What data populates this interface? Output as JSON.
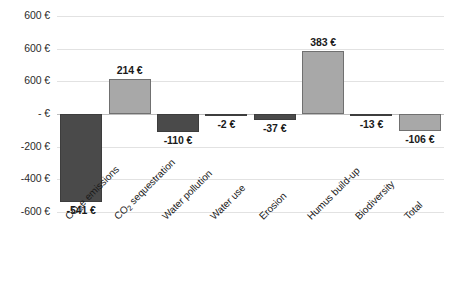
{
  "chart_data": {
    "type": "bar",
    "title": "",
    "xlabel": "",
    "ylabel": "",
    "categories": [
      "CO2e emissions",
      "CO2 sequestration",
      "Water pollution",
      "Water use",
      "Erosion",
      "Humus build-up",
      "Biodiversity",
      "Total"
    ],
    "values": [
      -541,
      214,
      -110,
      -2,
      -37,
      383,
      -13,
      -106
    ],
    "data_labels": [
      "-541 €",
      "214 €",
      "-110 €",
      "-2 €",
      "-37 €",
      "383 €",
      "-13 €",
      "-106 €"
    ],
    "ylim": [
      -600,
      600
    ],
    "ytick_values": [
      600,
      400,
      200,
      0,
      -200,
      -400,
      -600
    ],
    "ytick_labels": [
      "600 €",
      "600 €",
      "600 €",
      "- €",
      "-200 €",
      "-400 €",
      "-600 €"
    ],
    "grid": true,
    "legend": "none",
    "currency": "EUR",
    "colors": {
      "negative_bar": "#4a4a4a",
      "positive_bar": "#a8a8a8",
      "total_bar": "#a8a8a8",
      "gridline": "#e2e2e2",
      "zero_line": "#bdbdbd",
      "background": "#ffffff",
      "text": "#1a1a1a"
    }
  },
  "axis": {
    "y": {
      "ticks": [
        {
          "label": "600 €",
          "value": 600
        },
        {
          "label": "600 €",
          "value": 400
        },
        {
          "label": "600 €",
          "value": 200
        },
        {
          "label": "- €",
          "value": 0
        },
        {
          "label": "-200 €",
          "value": -200
        },
        {
          "label": "-400 €",
          "value": -400
        },
        {
          "label": "-600 €",
          "value": -600
        }
      ]
    },
    "x": {
      "categories": [
        {
          "label": "CO",
          "sub": "2",
          "rest": "e emissions",
          "full": "CO2e emissions"
        },
        {
          "label": "CO",
          "sub": "2",
          "rest": " sequestration",
          "full": "CO2 sequestration"
        },
        {
          "label": "Water pollution",
          "sub": "",
          "rest": "",
          "full": "Water pollution"
        },
        {
          "label": "Water use",
          "sub": "",
          "rest": "",
          "full": "Water use"
        },
        {
          "label": "Erosion",
          "sub": "",
          "rest": "",
          "full": "Erosion"
        },
        {
          "label": "Humus build-up",
          "sub": "",
          "rest": "",
          "full": "Humus build-up"
        },
        {
          "label": "Biodiversity",
          "sub": "",
          "rest": "",
          "full": "Biodiversity"
        },
        {
          "label": "Total",
          "sub": "",
          "rest": "",
          "full": "Total"
        }
      ]
    }
  },
  "series": [
    {
      "category_index": 0,
      "value": -541,
      "label": "-541 €",
      "style": "negative"
    },
    {
      "category_index": 1,
      "value": 214,
      "label": "214 €",
      "style": "positive"
    },
    {
      "category_index": 2,
      "value": -110,
      "label": "-110 €",
      "style": "negative"
    },
    {
      "category_index": 3,
      "value": -2,
      "label": "-2 €",
      "style": "negative"
    },
    {
      "category_index": 4,
      "value": -37,
      "label": "-37 €",
      "style": "negative"
    },
    {
      "category_index": 5,
      "value": 383,
      "label": "383 €",
      "style": "positive"
    },
    {
      "category_index": 6,
      "value": -13,
      "label": "-13 €",
      "style": "negative"
    },
    {
      "category_index": 7,
      "value": -106,
      "label": "-106 €",
      "style": "total"
    }
  ]
}
